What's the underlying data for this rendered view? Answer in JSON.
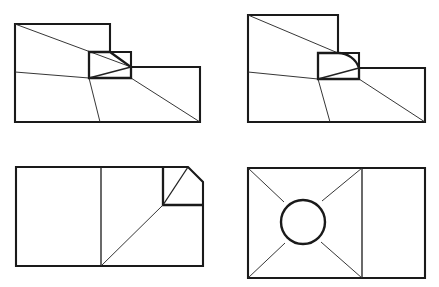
{
  "sheet": {
    "title": "Technical Line Drawings",
    "description": "Four monochrome engineering-style outline figures arranged in a two-by-two grid on a white sheet.",
    "width": 439,
    "height": 287,
    "background_color": "#ffffff",
    "line_color": "#1a1a1a",
    "thin_line_color": "#2b2b2b"
  },
  "figures": [
    {
      "id": "figure-top-left",
      "name": "stepped-block-with-pentagon-pocket",
      "position": "top-left",
      "description": "Stepped rectangular outline with a small pentagonal pocket at the step, crossed by thin diagonal construction lines.",
      "paths": {
        "outline": "M15,24 L110,24 L110,52 L131,52 L131,67 L200,67 L200,122 L15,122 Z",
        "pocket": "M89,52 L110,52 L131,67 L131,78 L89,78 Z",
        "pocket_diagonal": "M89,78 L131,67",
        "thin_diagonal_upper": "M15,24 L131,67",
        "thin_diagonal_lower": "M15,72 L89,78",
        "thin_diagonal_right": "M131,78 L200,122",
        "thin_vertical": "M89,78 L100,122"
      }
    },
    {
      "id": "figure-top-right",
      "name": "stepped-block-with-filleted-pocket",
      "position": "top-right",
      "description": "Stepped rectangular outline mirroring the first figure but with the pocket corner replaced by a concave fillet arc.",
      "paths": {
        "outline": "M248,15 L338,15 L338,53 L359,53 L359,68 L425,68 L425,122 L248,122 Z",
        "pocket": "M318,53 L338,53 A 22 22 0 0 1 359,68 L359,79 L318,79 Z",
        "pocket_diagonal": "M318,79 L359,68",
        "thin_diagonal_upper": "M248,15 L338,53",
        "thin_diagonal_lower": "M248,72 L318,79",
        "thin_diagonal_right": "M359,79 L425,122",
        "thin_vertical": "M318,79 L330,122"
      }
    },
    {
      "id": "figure-bottom-left",
      "name": "two-panel-block-with-chamfered-corner",
      "position": "bottom-left",
      "description": "Two-panel rectangle with a vertical divider; the upper-right corner is chamfered and contains a small bracket with a diagonal, plus a long thin diagonal to the divider base.",
      "paths": {
        "outline": "M16,167 L188,167 L203,182 L203,205 L203,266 L16,266 Z",
        "divider": "M101,167 L101,266",
        "corner_bracket": "M163,168 L163,205 L203,205",
        "chamfer_edge": "M188,167 L203,182",
        "bracket_diagonal": "M163,205 L188,167",
        "thin_diagonal": "M101,266 L163,205"
      }
    },
    {
      "id": "figure-bottom-right",
      "name": "two-panel-block-with-circle-and-crossed-diagonals",
      "position": "bottom-right",
      "description": "Two-panel rectangle with a vertical divider; the left square panel contains a centred circle with four thin diagonals running from the panel corners to the circle.",
      "paths": {
        "outline": "M248,168 L425,168 L425,278 L248,278 Z",
        "divider": "M362,168 L362,278",
        "diagonal_top_left": "M248,168 L284,202",
        "diagonal_top_right": "M362,168 L322,201",
        "diagonal_bottom_left": "M248,278 L285,243",
        "diagonal_bottom_right": "M362,278 L321,242"
      },
      "circle": {
        "center_x": 303,
        "center_y": 222,
        "radius": 22
      }
    }
  ]
}
